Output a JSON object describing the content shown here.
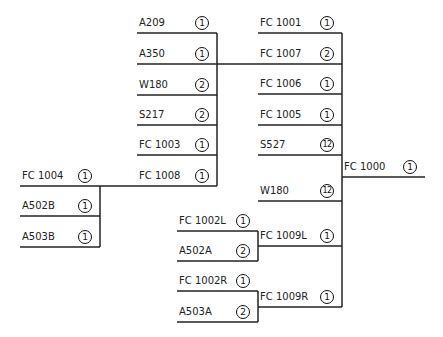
{
  "diagram": {
    "type": "bill-of-materials-tree",
    "root": {
      "label": "FC 1000",
      "qty": "1"
    },
    "nodes": [
      {
        "id": "n1",
        "label": "A209",
        "qty": "1",
        "x": 137,
        "y": 33,
        "w": 80
      },
      {
        "id": "n2",
        "label": "A350",
        "qty": "1",
        "x": 137,
        "y": 64,
        "w": 80
      },
      {
        "id": "n3",
        "label": "W180",
        "qty": "2",
        "x": 137,
        "y": 95,
        "w": 80
      },
      {
        "id": "n4",
        "label": "S217",
        "qty": "2",
        "x": 137,
        "y": 125,
        "w": 80
      },
      {
        "id": "n5",
        "label": "FC 1003",
        "qty": "1",
        "x": 137,
        "y": 155,
        "w": 80
      },
      {
        "id": "n6",
        "label": "FC 1008",
        "qty": "1",
        "x": 137,
        "y": 186,
        "w": 80
      },
      {
        "id": "n7",
        "label": "FC 1001",
        "qty": "1",
        "x": 258,
        "y": 33,
        "w": 84
      },
      {
        "id": "n8",
        "label": "FC 1007",
        "qty": "2",
        "x": 258,
        "y": 64,
        "w": 84
      },
      {
        "id": "n9",
        "label": "FC 1006",
        "qty": "1",
        "x": 258,
        "y": 94,
        "w": 84
      },
      {
        "id": "n10",
        "label": "FC 1005",
        "qty": "1",
        "x": 258,
        "y": 125,
        "w": 84
      },
      {
        "id": "n11",
        "label": "S527",
        "qty": "12",
        "x": 258,
        "y": 155,
        "w": 84
      },
      {
        "id": "n12",
        "label": "W180",
        "qty": "12",
        "x": 258,
        "y": 201,
        "w": 84
      },
      {
        "id": "n13",
        "label": "FC 1000",
        "qty": "1",
        "x": 342,
        "y": 177,
        "w": 83
      },
      {
        "id": "n14",
        "label": "FC 1004",
        "qty": "1",
        "x": 20,
        "y": 186,
        "w": 80
      },
      {
        "id": "n15",
        "label": "A502B",
        "qty": "1",
        "x": 20,
        "y": 216,
        "w": 80
      },
      {
        "id": "n16",
        "label": "A503B",
        "qty": "1",
        "x": 20,
        "y": 247,
        "w": 80
      },
      {
        "id": "n17",
        "label": "FC 1002L",
        "qty": "1",
        "x": 177,
        "y": 231,
        "w": 81
      },
      {
        "id": "n18",
        "label": "A502A",
        "qty": "2",
        "x": 177,
        "y": 261,
        "w": 81
      },
      {
        "id": "n19",
        "label": "FC 1009L",
        "qty": "1",
        "x": 258,
        "y": 246,
        "w": 84
      },
      {
        "id": "n20",
        "label": "FC 1002R",
        "qty": "1",
        "x": 177,
        "y": 291,
        "w": 81
      },
      {
        "id": "n21",
        "label": "A503A",
        "qty": "2",
        "x": 177,
        "y": 322,
        "w": 81
      },
      {
        "id": "n22",
        "label": "FC 1009R",
        "qty": "1",
        "x": 258,
        "y": 307,
        "w": 84
      }
    ],
    "connectors": [
      {
        "x1": 217,
        "y1": 33,
        "x2": 217,
        "y2": 186
      },
      {
        "x1": 217,
        "y1": 64,
        "x2": 258,
        "y2": 64
      },
      {
        "x1": 100,
        "y1": 186,
        "x2": 137,
        "y2": 186
      },
      {
        "x1": 100,
        "y1": 186,
        "x2": 100,
        "y2": 247
      },
      {
        "x1": 342,
        "y1": 33,
        "x2": 342,
        "y2": 307
      },
      {
        "x1": 258,
        "y1": 231,
        "x2": 258,
        "y2": 261
      },
      {
        "x1": 258,
        "y1": 291,
        "x2": 258,
        "y2": 322
      }
    ],
    "line_color": "#222222"
  }
}
